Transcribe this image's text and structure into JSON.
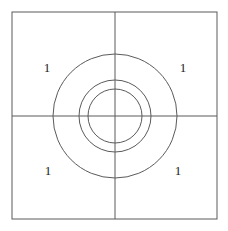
{
  "figure": {
    "name": "concentric-circles-in-square",
    "background_color": "#ffffff",
    "stroke_color": "#5a5a5a",
    "label_color": "#1a1a1a",
    "stroke_width": 1,
    "square": {
      "x": 12,
      "y": 12,
      "width": 205,
      "height": 207,
      "label": "square-border"
    },
    "center": {
      "x": 115,
      "y": 116
    },
    "circles": [
      {
        "name": "outer-circle",
        "radius": 62
      },
      {
        "name": "middle-circle",
        "radius": 36
      },
      {
        "name": "inner-circle",
        "radius": 27
      }
    ],
    "axes": [
      {
        "name": "horizontal-axis",
        "x1": 12,
        "y1": 116,
        "x2": 217,
        "y2": 116
      },
      {
        "name": "vertical-axis",
        "x1": 115,
        "y1": 12,
        "x2": 115,
        "y2": 219
      }
    ],
    "labels": [
      {
        "name": "label-top-left",
        "text": "1",
        "x": 47,
        "y": 69
      },
      {
        "name": "label-top-right",
        "text": "1",
        "x": 183,
        "y": 69
      },
      {
        "name": "label-bottom-left",
        "text": "1",
        "x": 48,
        "y": 172
      },
      {
        "name": "label-bottom-right",
        "text": "1",
        "x": 178,
        "y": 172
      }
    ]
  }
}
